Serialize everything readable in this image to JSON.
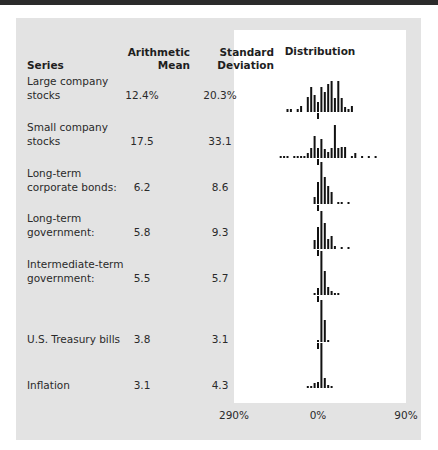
{
  "table": {
    "headers": {
      "series": "Series",
      "mean": "Arithmetic Mean",
      "mean_line1": "Arithmetic",
      "mean_line2": "Mean",
      "sd_line1": "Standard",
      "sd_line2": "Deviation",
      "distribution": "Distribution"
    },
    "rows": [
      {
        "name_line1": "Large company",
        "name_line2": "stocks",
        "mean": "12.4%",
        "sd": "20.3%"
      },
      {
        "name_line1": "Small company",
        "name_line2": "stocks",
        "mean": "17.5",
        "sd": "33.1"
      },
      {
        "name_line1": "Long-term",
        "name_line2": "corporate bonds:",
        "mean": "6.2",
        "sd": "8.6"
      },
      {
        "name_line1": "Long-term",
        "name_line2": "government:",
        "mean": "5.8",
        "sd": "9.3"
      },
      {
        "name_line1": "Intermediate-term",
        "name_line2": "government:",
        "mean": "5.5",
        "sd": "5.7"
      },
      {
        "name_line1": "",
        "name_line2": "U.S. Treasury bills",
        "mean": "3.8",
        "sd": "3.1"
      },
      {
        "name_line1": "",
        "name_line2": "Inflation",
        "mean": "3.1",
        "sd": "4.3"
      }
    ],
    "axis_labels": [
      "290%",
      "0%",
      "90%"
    ]
  },
  "colors": {
    "panel": "#e3e3e3",
    "distribution_box": "#ffffff",
    "bars": "#111111",
    "topbar": "#2b2b2b"
  },
  "chart_data": {
    "type": "bar",
    "title": "Distribution",
    "xlabel": "",
    "ylabel": "",
    "x_tick_labels": [
      "290%",
      "0%",
      "90%"
    ],
    "x_range_percent": [
      -90,
      90
    ],
    "bin_width_percent": 5,
    "grid": false,
    "series": [
      {
        "name": "Large company stocks",
        "baseline_y": 82,
        "bins": [
          [
            -45,
            3
          ],
          [
            -40,
            3
          ],
          [
            -30,
            3
          ],
          [
            -25,
            6
          ],
          [
            -15,
            15
          ],
          [
            -10,
            25
          ],
          [
            -5,
            17
          ],
          [
            0,
            10
          ],
          [
            5,
            25
          ],
          [
            10,
            20
          ],
          [
            15,
            28
          ],
          [
            20,
            31
          ],
          [
            25,
            14
          ],
          [
            30,
            31
          ],
          [
            35,
            14
          ],
          [
            40,
            5
          ],
          [
            45,
            3
          ],
          [
            50,
            6
          ]
        ]
      },
      {
        "name": "Small company stocks",
        "baseline_y": 128,
        "bins": [
          [
            -55,
            2
          ],
          [
            -50,
            2
          ],
          [
            -45,
            2
          ],
          [
            -35,
            2
          ],
          [
            -30,
            2
          ],
          [
            -25,
            2
          ],
          [
            -20,
            2
          ],
          [
            -15,
            5
          ],
          [
            -10,
            10
          ],
          [
            -5,
            22
          ],
          [
            0,
            10
          ],
          [
            5,
            19
          ],
          [
            10,
            9
          ],
          [
            15,
            6
          ],
          [
            20,
            10
          ],
          [
            25,
            33
          ],
          [
            30,
            10
          ],
          [
            35,
            11
          ],
          [
            40,
            11
          ],
          [
            50,
            2
          ],
          [
            55,
            5
          ],
          [
            65,
            2
          ],
          [
            75,
            2
          ],
          [
            85,
            2
          ]
        ]
      },
      {
        "name": "Long-term corporate bonds",
        "baseline_y": 174,
        "bins": [
          [
            -5,
            7
          ],
          [
            0,
            22
          ],
          [
            5,
            42
          ],
          [
            10,
            27
          ],
          [
            15,
            18
          ],
          [
            20,
            12
          ],
          [
            30,
            2
          ],
          [
            35,
            2
          ],
          [
            45,
            2
          ]
        ]
      },
      {
        "name": "Long-term government",
        "baseline_y": 219,
        "bins": [
          [
            -5,
            9
          ],
          [
            0,
            22
          ],
          [
            5,
            38
          ],
          [
            10,
            26
          ],
          [
            15,
            10
          ],
          [
            20,
            13
          ],
          [
            25,
            3
          ],
          [
            35,
            2
          ],
          [
            45,
            2
          ]
        ]
      },
      {
        "name": "Intermediate-term government",
        "baseline_y": 265,
        "bins": [
          [
            -5,
            2
          ],
          [
            0,
            7
          ],
          [
            5,
            44
          ],
          [
            10,
            24
          ],
          [
            15,
            8
          ],
          [
            20,
            4
          ],
          [
            25,
            2
          ],
          [
            30,
            2
          ]
        ]
      },
      {
        "name": "U.S. Treasury bills",
        "baseline_y": 312,
        "bins": [
          [
            0,
            2
          ],
          [
            5,
            42
          ],
          [
            10,
            22
          ],
          [
            15,
            2
          ]
        ]
      },
      {
        "name": "Inflation",
        "baseline_y": 358,
        "bins": [
          [
            -15,
            2
          ],
          [
            -10,
            2
          ],
          [
            -5,
            5
          ],
          [
            0,
            6
          ],
          [
            5,
            45
          ],
          [
            10,
            10
          ],
          [
            15,
            3
          ],
          [
            20,
            2
          ]
        ]
      }
    ]
  }
}
